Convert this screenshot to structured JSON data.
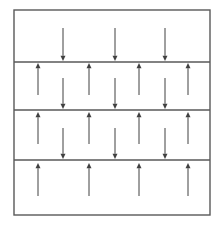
{
  "figure": {
    "title": "",
    "type": "schematic-diagram",
    "background_color": "#ffffff",
    "line_color": "#595959",
    "arrow_color": "#404040",
    "outer_border": {
      "x": 14,
      "y": 10,
      "width": 196,
      "height": 205,
      "stroke_width": 1.4
    },
    "dividers": [
      {
        "name": "divider-1",
        "y": 62,
        "x_start": 14,
        "x_end": 210,
        "stroke_width": 1.6
      },
      {
        "name": "divider-2",
        "y": 110,
        "x_start": 14,
        "x_end": 210,
        "stroke_width": 1.6
      },
      {
        "name": "divider-3",
        "y": 160,
        "x_start": 14,
        "x_end": 210,
        "stroke_width": 1.6
      }
    ],
    "bands": [
      {
        "name": "band-1",
        "index": 1,
        "y_top": 10,
        "y_bottom": 62,
        "label": ""
      },
      {
        "name": "band-2",
        "index": 2,
        "y_top": 62,
        "y_bottom": 110,
        "label": ""
      },
      {
        "name": "band-3",
        "index": 3,
        "y_top": 110,
        "y_bottom": 160,
        "label": ""
      },
      {
        "name": "band-4",
        "index": 4,
        "y_top": 160,
        "y_bottom": 215,
        "label": ""
      }
    ],
    "arrow_columns": {
      "down_x": [
        63,
        115,
        165
      ],
      "up_x": [
        38,
        89,
        139,
        188
      ]
    },
    "arrows": [
      {
        "name": "arrow-down-b1-c1",
        "direction": "down",
        "x": 63,
        "tail_y": 28,
        "head_y": 61
      },
      {
        "name": "arrow-down-b1-c2",
        "direction": "down",
        "x": 115,
        "tail_y": 28,
        "head_y": 61
      },
      {
        "name": "arrow-down-b1-c3",
        "direction": "down",
        "x": 165,
        "tail_y": 28,
        "head_y": 61
      },
      {
        "name": "arrow-up-b2-c1",
        "direction": "up",
        "x": 38,
        "tail_y": 95,
        "head_y": 63
      },
      {
        "name": "arrow-up-b2-c2",
        "direction": "up",
        "x": 89,
        "tail_y": 95,
        "head_y": 63
      },
      {
        "name": "arrow-up-b2-c3",
        "direction": "up",
        "x": 139,
        "tail_y": 95,
        "head_y": 63
      },
      {
        "name": "arrow-up-b2-c4",
        "direction": "up",
        "x": 188,
        "tail_y": 95,
        "head_y": 63
      },
      {
        "name": "arrow-down-b2-c1",
        "direction": "down",
        "x": 63,
        "tail_y": 78,
        "head_y": 109
      },
      {
        "name": "arrow-down-b2-c2",
        "direction": "down",
        "x": 115,
        "tail_y": 78,
        "head_y": 109
      },
      {
        "name": "arrow-down-b2-c3",
        "direction": "down",
        "x": 165,
        "tail_y": 78,
        "head_y": 109
      },
      {
        "name": "arrow-up-b3-c1",
        "direction": "up",
        "x": 38,
        "tail_y": 144,
        "head_y": 112
      },
      {
        "name": "arrow-up-b3-c2",
        "direction": "up",
        "x": 89,
        "tail_y": 144,
        "head_y": 112
      },
      {
        "name": "arrow-up-b3-c3",
        "direction": "up",
        "x": 139,
        "tail_y": 144,
        "head_y": 112
      },
      {
        "name": "arrow-up-b3-c4",
        "direction": "up",
        "x": 188,
        "tail_y": 144,
        "head_y": 112
      },
      {
        "name": "arrow-down-b3-c1",
        "direction": "down",
        "x": 63,
        "tail_y": 128,
        "head_y": 159
      },
      {
        "name": "arrow-down-b3-c2",
        "direction": "down",
        "x": 115,
        "tail_y": 128,
        "head_y": 159
      },
      {
        "name": "arrow-down-b3-c3",
        "direction": "down",
        "x": 165,
        "tail_y": 128,
        "head_y": 159
      },
      {
        "name": "arrow-up-b4-c1",
        "direction": "up",
        "x": 38,
        "tail_y": 196,
        "head_y": 163
      },
      {
        "name": "arrow-up-b4-c2",
        "direction": "up",
        "x": 89,
        "tail_y": 196,
        "head_y": 163
      },
      {
        "name": "arrow-up-b4-c3",
        "direction": "up",
        "x": 139,
        "tail_y": 196,
        "head_y": 163
      },
      {
        "name": "arrow-up-b4-c4",
        "direction": "up",
        "x": 188,
        "tail_y": 196,
        "head_y": 163
      }
    ]
  }
}
